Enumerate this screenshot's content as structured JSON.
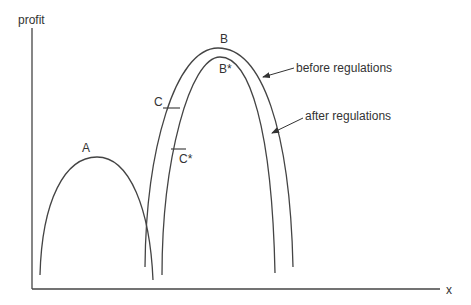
{
  "diagram": {
    "axes": {
      "y_label": "profit",
      "x_label": "x"
    },
    "points": {
      "A": "A",
      "B": "B",
      "B_star": "B*",
      "C": "C",
      "C_star": "C*"
    },
    "annotations": {
      "before": "before regulations",
      "after": "after regulations"
    },
    "colors": {
      "line": "#444444",
      "text": "#333333",
      "background": "#ffffff"
    }
  }
}
